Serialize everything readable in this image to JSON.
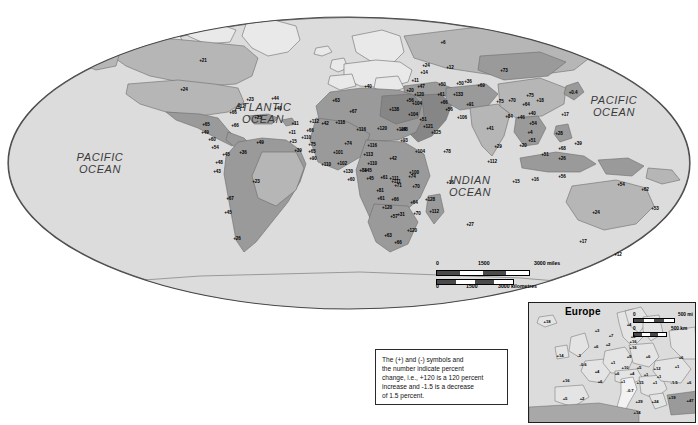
{
  "map": {
    "title": "World Population Percent Change",
    "projection": "oval",
    "ocean_labels": [
      {
        "name": "pacific-ocean-west",
        "text": "PACIFIC\nOCEAN",
        "x": 100,
        "y": 163
      },
      {
        "name": "atlantic-ocean",
        "text": "ATLANTIC\nOCEAN",
        "x": 263,
        "y": 113
      },
      {
        "name": "indian-ocean",
        "text": "INDIAN\nOCEAN",
        "x": 470,
        "y": 186
      },
      {
        "name": "pacific-ocean-east",
        "text": "PACIFIC\nOCEAN",
        "x": 614,
        "y": 106
      }
    ],
    "colors": {
      "ocean": "#dcdcdc",
      "land_light": "#e9e9e9",
      "land_mid": "#b6b6b6",
      "land_dark": "#9a9a9a",
      "land_darker": "#868686",
      "outline": "#6d6d6d",
      "border": "#2a2a2a",
      "text": "#000000"
    },
    "scalebar": {
      "name": "map-scale-bar",
      "miles": {
        "ticks": [
          "0",
          "1500",
          "3000 miles"
        ]
      },
      "kilometres": {
        "ticks": [
          "0",
          "1500",
          "3000 kilometres"
        ]
      }
    },
    "legend": {
      "name": "legend-note",
      "lines": [
        "The  (+) and (-) symbols and",
        "the number indicate percent",
        "change, i.e., +120 is a 120 percent",
        "increase and -1.5 is a decrease",
        "of 1.5 percent."
      ]
    },
    "values": [
      {
        "v": "+6",
        "x": 443,
        "y": 43
      },
      {
        "v": "+21",
        "x": 203,
        "y": 61
      },
      {
        "v": "+24",
        "x": 184,
        "y": 90
      },
      {
        "v": "+23",
        "x": 250,
        "y": 100
      },
      {
        "v": "+44",
        "x": 275,
        "y": 99
      },
      {
        "v": "+12",
        "x": 241,
        "y": 107
      },
      {
        "v": "+40",
        "x": 278,
        "y": 109
      },
      {
        "v": "+25",
        "x": 258,
        "y": 118
      },
      {
        "v": "+66",
        "x": 233,
        "y": 113
      },
      {
        "v": "+65",
        "x": 206,
        "y": 125
      },
      {
        "v": "+66",
        "x": 235,
        "y": 126
      },
      {
        "v": "+49",
        "x": 205,
        "y": 133
      },
      {
        "v": "+60",
        "x": 212,
        "y": 140
      },
      {
        "v": "+54",
        "x": 215,
        "y": 148
      },
      {
        "v": "+45",
        "x": 226,
        "y": 155
      },
      {
        "v": "+11",
        "x": 295,
        "y": 124
      },
      {
        "v": "+11",
        "x": 292,
        "y": 133
      },
      {
        "v": "+15",
        "x": 293,
        "y": 142
      },
      {
        "v": "+39",
        "x": 298,
        "y": 151
      },
      {
        "v": "+49",
        "x": 260,
        "y": 143
      },
      {
        "v": "+36",
        "x": 243,
        "y": 153
      },
      {
        "v": "+48",
        "x": 219,
        "y": 163
      },
      {
        "v": "+43",
        "x": 217,
        "y": 172
      },
      {
        "v": "+23",
        "x": 256,
        "y": 182
      },
      {
        "v": "+67",
        "x": 230,
        "y": 199
      },
      {
        "v": "+45",
        "x": 228,
        "y": 213
      },
      {
        "v": "+26",
        "x": 237,
        "y": 239
      },
      {
        "v": "+40",
        "x": 368,
        "y": 87
      },
      {
        "v": "+63",
        "x": 336,
        "y": 101
      },
      {
        "v": "+67",
        "x": 353,
        "y": 112
      },
      {
        "v": "+138",
        "x": 394,
        "y": 110
      },
      {
        "v": "+42",
        "x": 325,
        "y": 124
      },
      {
        "v": "+112",
        "x": 314,
        "y": 122
      },
      {
        "v": "+118",
        "x": 340,
        "y": 123
      },
      {
        "v": "+116",
        "x": 361,
        "y": 130
      },
      {
        "v": "+120",
        "x": 382,
        "y": 129
      },
      {
        "v": "+68",
        "x": 404,
        "y": 130
      },
      {
        "v": "+66",
        "x": 310,
        "y": 131
      },
      {
        "v": "+110",
        "x": 306,
        "y": 138
      },
      {
        "v": "+75",
        "x": 312,
        "y": 145
      },
      {
        "v": "+74",
        "x": 348,
        "y": 144
      },
      {
        "v": "+116",
        "x": 372,
        "y": 146
      },
      {
        "v": "+65",
        "x": 312,
        "y": 152
      },
      {
        "v": "+101",
        "x": 338,
        "y": 153
      },
      {
        "v": "+113",
        "x": 368,
        "y": 155
      },
      {
        "v": "+90",
        "x": 313,
        "y": 159
      },
      {
        "v": "+110",
        "x": 326,
        "y": 165
      },
      {
        "v": "+102",
        "x": 342,
        "y": 164
      },
      {
        "v": "+110",
        "x": 372,
        "y": 164
      },
      {
        "v": "+42",
        "x": 393,
        "y": 159
      },
      {
        "v": "+130",
        "x": 348,
        "y": 172
      },
      {
        "v": "+88",
        "x": 363,
        "y": 171
      },
      {
        "v": "+45",
        "x": 370,
        "y": 179
      },
      {
        "v": "+60",
        "x": 351,
        "y": 180
      },
      {
        "v": "+61",
        "x": 384,
        "y": 178
      },
      {
        "v": "+81",
        "x": 380,
        "y": 191
      },
      {
        "v": "+111",
        "x": 394,
        "y": 179
      },
      {
        "v": "+74",
        "x": 412,
        "y": 177
      },
      {
        "v": "+70",
        "x": 416,
        "y": 187
      },
      {
        "v": "+45",
        "x": 368,
        "y": 171
      },
      {
        "v": "+111",
        "x": 396,
        "y": 182
      },
      {
        "v": "+71",
        "x": 398,
        "y": 186
      },
      {
        "v": "+100",
        "x": 414,
        "y": 173
      },
      {
        "v": "+61",
        "x": 381,
        "y": 199
      },
      {
        "v": "+66",
        "x": 395,
        "y": 200
      },
      {
        "v": "+64",
        "x": 414,
        "y": 203
      },
      {
        "v": "+128",
        "x": 430,
        "y": 200
      },
      {
        "v": "+112",
        "x": 434,
        "y": 212
      },
      {
        "v": "+31",
        "x": 401,
        "y": 215
      },
      {
        "v": "+70",
        "x": 417,
        "y": 214
      },
      {
        "v": "+120",
        "x": 387,
        "y": 208
      },
      {
        "v": "+57",
        "x": 394,
        "y": 217
      },
      {
        "v": "+120",
        "x": 412,
        "y": 231
      },
      {
        "v": "+63",
        "x": 388,
        "y": 236
      },
      {
        "v": "+66",
        "x": 398,
        "y": 243
      },
      {
        "v": "+27",
        "x": 470,
        "y": 225
      },
      {
        "v": "+16",
        "x": 450,
        "y": 183
      },
      {
        "v": "+14",
        "x": 424,
        "y": 73
      },
      {
        "v": "+11",
        "x": 415,
        "y": 81
      },
      {
        "v": "+47",
        "x": 421,
        "y": 87
      },
      {
        "v": "+20",
        "x": 410,
        "y": 91
      },
      {
        "v": "+120",
        "x": 419,
        "y": 95
      },
      {
        "v": "+104",
        "x": 417,
        "y": 104
      },
      {
        "v": "+56",
        "x": 410,
        "y": 101
      },
      {
        "v": "+104",
        "x": 413,
        "y": 115
      },
      {
        "v": "+51",
        "x": 423,
        "y": 120
      },
      {
        "v": "+121",
        "x": 428,
        "y": 127
      },
      {
        "v": "+114",
        "x": 401,
        "y": 130
      },
      {
        "v": "+93",
        "x": 404,
        "y": 141
      },
      {
        "v": "+104",
        "x": 420,
        "y": 152
      },
      {
        "v": "+78",
        "x": 447,
        "y": 152
      },
      {
        "v": "+125",
        "x": 436,
        "y": 133
      },
      {
        "v": "+24",
        "x": 426,
        "y": 66
      },
      {
        "v": "+12",
        "x": 450,
        "y": 68
      },
      {
        "v": "+50",
        "x": 442,
        "y": 85
      },
      {
        "v": "+50",
        "x": 460,
        "y": 84
      },
      {
        "v": "+36",
        "x": 468,
        "y": 82
      },
      {
        "v": "+69",
        "x": 481,
        "y": 86
      },
      {
        "v": "+61",
        "x": 441,
        "y": 95
      },
      {
        "v": "+133",
        "x": 458,
        "y": 95
      },
      {
        "v": "+66",
        "x": 444,
        "y": 103
      },
      {
        "v": "+56",
        "x": 449,
        "y": 110
      },
      {
        "v": "+91",
        "x": 470,
        "y": 105
      },
      {
        "v": "+106",
        "x": 462,
        "y": 118
      },
      {
        "v": "+41",
        "x": 490,
        "y": 129
      },
      {
        "v": "+73",
        "x": 504,
        "y": 71
      },
      {
        "v": "+75",
        "x": 500,
        "y": 102
      },
      {
        "v": "+70",
        "x": 512,
        "y": 101
      },
      {
        "v": "+84",
        "x": 509,
        "y": 117
      },
      {
        "v": "+46",
        "x": 521,
        "y": 118
      },
      {
        "v": "+29",
        "x": 498,
        "y": 147
      },
      {
        "v": "+112",
        "x": 492,
        "y": 162
      },
      {
        "v": "+15",
        "x": 516,
        "y": 182
      },
      {
        "v": "+75",
        "x": 530,
        "y": 96
      },
      {
        "v": "+18",
        "x": 540,
        "y": 101
      },
      {
        "v": "+0.4",
        "x": 573,
        "y": 93
      },
      {
        "v": "+64",
        "x": 526,
        "y": 105
      },
      {
        "v": "+40",
        "x": 532,
        "y": 114
      },
      {
        "v": "+17",
        "x": 565,
        "y": 115
      },
      {
        "v": "+54",
        "x": 533,
        "y": 124
      },
      {
        "v": "+4",
        "x": 530,
        "y": 133
      },
      {
        "v": "+28",
        "x": 559,
        "y": 134
      },
      {
        "v": "+51",
        "x": 532,
        "y": 141
      },
      {
        "v": "+39",
        "x": 578,
        "y": 144
      },
      {
        "v": "+20",
        "x": 523,
        "y": 146
      },
      {
        "v": "+51",
        "x": 545,
        "y": 155
      },
      {
        "v": "+68",
        "x": 562,
        "y": 149
      },
      {
        "v": "+26",
        "x": 562,
        "y": 159
      },
      {
        "v": "+56",
        "x": 562,
        "y": 177
      },
      {
        "v": "+16",
        "x": 535,
        "y": 180
      },
      {
        "v": "+54",
        "x": 621,
        "y": 185
      },
      {
        "v": "+62",
        "x": 645,
        "y": 190
      },
      {
        "v": "+53",
        "x": 655,
        "y": 209
      },
      {
        "v": "+24",
        "x": 596,
        "y": 213
      },
      {
        "v": "+17",
        "x": 583,
        "y": 242
      },
      {
        "v": "+12",
        "x": 618,
        "y": 255
      }
    ]
  },
  "europe_inset": {
    "name": "europe-inset",
    "title": "Europe",
    "scalebar": {
      "miles": [
        "0",
        "500 mi"
      ],
      "km": [
        "0",
        "500 km"
      ]
    },
    "values": [
      {
        "v": "+18",
        "x": 18,
        "y": 19
      },
      {
        "v": "+3",
        "x": 68,
        "y": 28
      },
      {
        "v": "+4",
        "x": 100,
        "y": 22
      },
      {
        "v": "+7",
        "x": 82,
        "y": 33
      },
      {
        "v": "+5",
        "x": 104,
        "y": 34
      },
      {
        "v": "+16",
        "x": 104,
        "y": 39
      },
      {
        "v": "+2",
        "x": 79,
        "y": 42
      },
      {
        "v": "+6",
        "x": 67,
        "y": 44
      },
      {
        "v": "+16",
        "x": 104,
        "y": 45
      },
      {
        "v": "+14",
        "x": 31,
        "y": 53
      },
      {
        "v": "-3",
        "x": 50,
        "y": 53
      },
      {
        "v": "+9",
        "x": 100,
        "y": 54
      },
      {
        "v": "+6",
        "x": 119,
        "y": 54
      },
      {
        "v": "+6",
        "x": 152,
        "y": 55
      },
      {
        "v": "-0.6",
        "x": 54,
        "y": 62
      },
      {
        "v": "+1",
        "x": 84,
        "y": 60
      },
      {
        "v": "+10",
        "x": 96,
        "y": 65
      },
      {
        "v": "+5",
        "x": 110,
        "y": 65
      },
      {
        "v": "+12",
        "x": 128,
        "y": 66
      },
      {
        "v": "+1",
        "x": 148,
        "y": 64
      },
      {
        "v": "+4",
        "x": 68,
        "y": 69
      },
      {
        "v": "+6",
        "x": 88,
        "y": 71
      },
      {
        "v": "+4",
        "x": 103,
        "y": 71
      },
      {
        "v": "+1",
        "x": 117,
        "y": 72
      },
      {
        "v": "+1",
        "x": 130,
        "y": 74
      },
      {
        "v": "+16",
        "x": 37,
        "y": 78
      },
      {
        "v": "+6",
        "x": 71,
        "y": 79
      },
      {
        "v": "+1",
        "x": 94,
        "y": 79
      },
      {
        "v": "+15",
        "x": 111,
        "y": 80
      },
      {
        "v": "+1",
        "x": 126,
        "y": 80
      },
      {
        "v": "-1.5",
        "x": 145,
        "y": 80
      },
      {
        "v": "+6",
        "x": 160,
        "y": 80
      },
      {
        "v": "-0.7",
        "x": 101,
        "y": 88
      },
      {
        "v": "+5",
        "x": 36,
        "y": 96
      },
      {
        "v": "+2",
        "x": 53,
        "y": 96
      },
      {
        "v": "+19",
        "x": 143,
        "y": 95
      },
      {
        "v": "+24",
        "x": 126,
        "y": 99
      },
      {
        "v": "+47",
        "x": 161,
        "y": 98
      },
      {
        "v": "+29",
        "x": 110,
        "y": 99
      },
      {
        "v": "+14",
        "x": 108,
        "y": 110
      }
    ]
  }
}
